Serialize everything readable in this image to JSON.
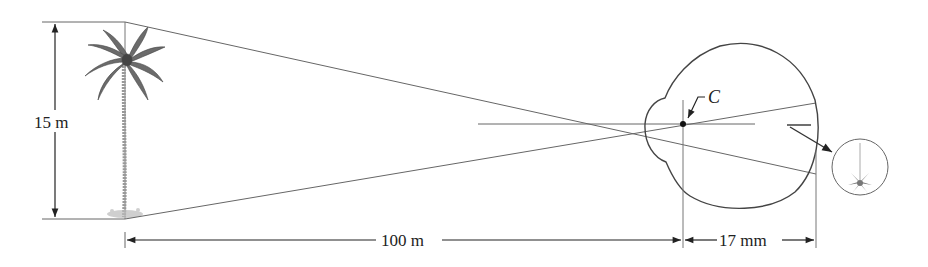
{
  "figure": {
    "labels": {
      "object_height": "15 m",
      "object_distance": "100 m",
      "image_distance": "17 mm",
      "optical_center": "C"
    },
    "objects": {
      "tree": "palm-tree",
      "eye": "eyeball-cross-section",
      "inset": "inverted-tree-image-on-retina"
    },
    "colors": {
      "line": "#555555",
      "text": "#222222",
      "foliage": "#6b6b6b"
    }
  }
}
